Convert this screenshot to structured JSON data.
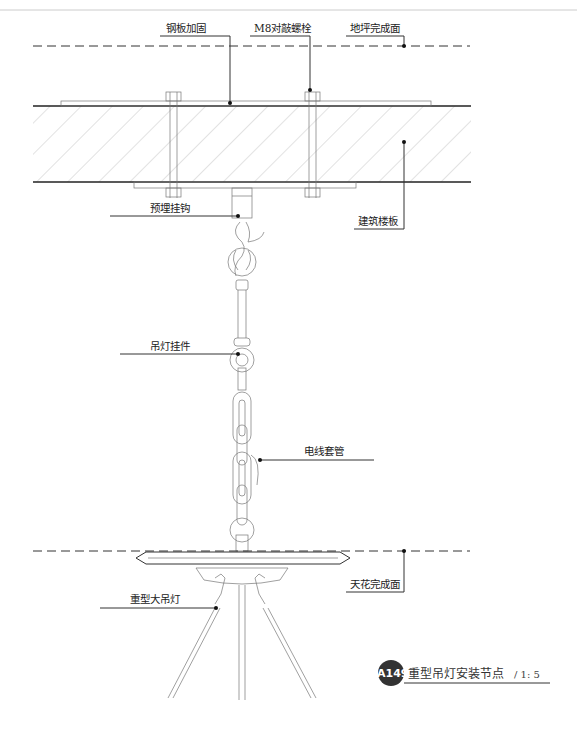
{
  "drawing": {
    "title": "重型吊灯安装节点",
    "scale": "/ 1: 5",
    "badge": "A149",
    "badge_color": "#333333"
  },
  "labels": {
    "steel_plate": "钢板加固",
    "bolt": "M8对敲螺栓",
    "floor_finish": "地坪完成面",
    "embedded_hook": "预埋挂钩",
    "building_slab": "建筑楼板",
    "pendant_fitting": "吊灯挂件",
    "conduit": "电线套管",
    "ceiling_finish": "天花完成面",
    "chandelier": "重型大吊灯"
  }
}
